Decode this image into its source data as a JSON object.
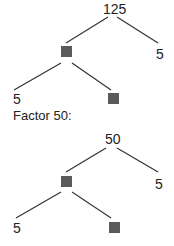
{
  "trees": [
    {
      "root": "125",
      "right_leaf": "5",
      "left_child": "blank",
      "bottom_left": "5",
      "bottom_right": "blank"
    },
    {
      "caption": "Factor 50:",
      "root": "50",
      "right_leaf": "5",
      "left_child": "blank",
      "bottom_left": "5",
      "bottom_right": "blank"
    }
  ],
  "colors": {
    "line": "#333333",
    "blank_box": "#5a5a5a"
  }
}
